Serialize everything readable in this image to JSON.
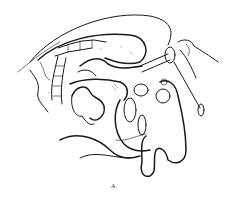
{
  "figure": {
    "caption": "A",
    "colors": {
      "ink": "#1a1a1a",
      "background": "#ffffff",
      "caption": "#444444"
    }
  }
}
